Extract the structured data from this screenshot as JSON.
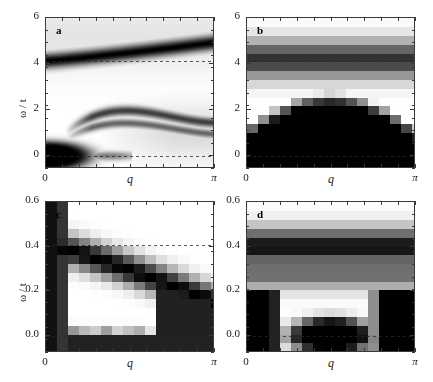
{
  "figure": {
    "width": 433,
    "height": 382,
    "background": "#ffffff",
    "colormap": "grayscale-inverted",
    "colormap_low": "#ffffff",
    "colormap_high": "#000000"
  },
  "axis_titles": {
    "x": "q",
    "y": "ω / t"
  },
  "chart_data": [
    {
      "type": "heatmap",
      "panel": "a",
      "label": "a",
      "title": "",
      "xlabel": "q",
      "ylabel": "ω / t",
      "xlim": [
        0,
        3.14159
      ],
      "ylim": [
        -0.55,
        6.0
      ],
      "xtick_labels": [
        "0",
        "π"
      ],
      "xtick_values": [
        0,
        3.14159
      ],
      "ytick_labels": [
        "0",
        "2",
        "4",
        "6"
      ],
      "ytick_values": [
        0,
        2,
        4,
        6
      ],
      "xminor_count": 10,
      "yminor_count": 12,
      "grid": false,
      "legend": "none",
      "dashed_guides": [
        0.0,
        4.15
      ],
      "features": [
        {
          "name": "upper-band",
          "kind": "dispersive-ridge",
          "omega_at_q0": 4.15,
          "omega_at_qpi": 4.95,
          "width": 0.22,
          "intensity": 1.0
        },
        {
          "name": "zero-mode-blob",
          "kind": "blob",
          "q": 0.0,
          "omega": 0.0,
          "q_extent": 0.55,
          "omega_extent": 0.42,
          "intensity": 1.0
        },
        {
          "name": "low-band-arch",
          "kind": "arch",
          "omega_at_q0": 0.0,
          "omega_peak": 1.85,
          "q_peak": 2.0,
          "omega_at_qpi": 1.45,
          "width": 0.14,
          "intensity": 0.72
        },
        {
          "name": "second-arch",
          "kind": "arch",
          "omega_at_q0": 0.0,
          "omega_peak": 1.35,
          "q_peak": 1.9,
          "omega_at_qpi": 0.95,
          "width": 0.12,
          "intensity": 0.55
        },
        {
          "name": "zero-line-streak",
          "kind": "streak",
          "omega": 0.0,
          "q_start": 0.7,
          "q_end": 1.6,
          "intensity": 0.45
        }
      ]
    },
    {
      "type": "heatmap",
      "panel": "b",
      "label": "b",
      "title": "",
      "xlabel": "q",
      "ylabel": "",
      "xlim": [
        0,
        3.14159
      ],
      "ylim": [
        -0.55,
        6.0
      ],
      "xtick_labels": [
        "0",
        "π"
      ],
      "xtick_values": [
        0,
        3.14159
      ],
      "ytick_labels": [
        "0",
        "2",
        "4",
        "6"
      ],
      "ytick_values": [
        0,
        2,
        4,
        6
      ],
      "xminor_count": 10,
      "yminor_count": 12,
      "grid": false,
      "legend": "none",
      "dashed_guides": [
        0.0,
        4.15
      ],
      "features": [
        {
          "name": "flat-band",
          "kind": "flat-ridge",
          "omega": 4.2,
          "width": 0.55,
          "intensity": 0.78
        },
        {
          "name": "continuum-edge",
          "kind": "inverted-arch-fill",
          "omega_at_q0": 1.35,
          "omega_peak": 2.8,
          "q_peak": 1.57,
          "omega_at_qpi": 1.35,
          "intensity": 1.0
        },
        {
          "name": "sub-zero-lobe",
          "kind": "lower-fill",
          "omega": -0.35,
          "intensity": 0.9
        }
      ]
    },
    {
      "type": "heatmap",
      "panel": "c",
      "label": "c",
      "title": "",
      "xlabel": "q",
      "ylabel": "ω / t",
      "xlim": [
        0,
        3.14159
      ],
      "ylim": [
        -0.075,
        0.6
      ],
      "xtick_labels": [
        "0",
        "π"
      ],
      "xtick_values": [
        0,
        3.14159
      ],
      "ytick_labels": [
        "0.0",
        "0.2",
        "0.4",
        "0.6"
      ],
      "ytick_values": [
        0.0,
        0.2,
        0.4,
        0.6
      ],
      "xminor_count": 10,
      "yminor_count": 12,
      "grid": false,
      "legend": "none",
      "dashed_guides": [
        0.0,
        0.41
      ],
      "features": [
        {
          "name": "q0-vertical-dark-column",
          "kind": "column",
          "q_start": 0.0,
          "q_end": 0.33,
          "intensity": 1.0
        },
        {
          "name": "descending-band",
          "kind": "dispersive-ridge",
          "omega_at_q0": 0.41,
          "omega_at_qpi": 0.155,
          "width": 0.045,
          "intensity": 1.0
        },
        {
          "name": "zero-line-spots",
          "kind": "periodic-spots",
          "omega": 0.0,
          "count": 5,
          "intensity": 0.8
        },
        {
          "name": "lower-right-dark",
          "kind": "corner-fill",
          "intensity": 0.85
        }
      ]
    },
    {
      "type": "heatmap",
      "panel": "d",
      "label": "d",
      "title": "",
      "xlabel": "q",
      "ylabel": "",
      "xlim": [
        0,
        3.14159
      ],
      "ylim": [
        -0.075,
        0.6
      ],
      "xtick_labels": [
        "0",
        "π"
      ],
      "xtick_values": [
        0,
        3.14159
      ],
      "ytick_labels": [
        "0.0",
        "0.2",
        "0.4",
        "0.6"
      ],
      "ytick_values": [
        0.0,
        0.2,
        0.4,
        0.6
      ],
      "xminor_count": 10,
      "yminor_count": 12,
      "grid": false,
      "legend": "none",
      "dashed_guides": [
        0.0,
        0.41
      ],
      "features": [
        {
          "name": "flat-band",
          "kind": "flat-ridge",
          "omega": 0.4,
          "width": 0.055,
          "intensity": 0.95
        },
        {
          "name": "secondary-band",
          "kind": "flat-ridge",
          "omega": 0.285,
          "width": 0.05,
          "intensity": 0.55
        },
        {
          "name": "central-zero-blob",
          "kind": "blob",
          "q": 1.57,
          "omega": 0.0,
          "q_extent": 0.52,
          "omega_extent": 0.055,
          "intensity": 1.0
        },
        {
          "name": "left-dark-region",
          "kind": "corner-fill",
          "intensity": 1.0
        },
        {
          "name": "right-dark-region",
          "kind": "corner-fill",
          "intensity": 1.0
        }
      ]
    }
  ]
}
